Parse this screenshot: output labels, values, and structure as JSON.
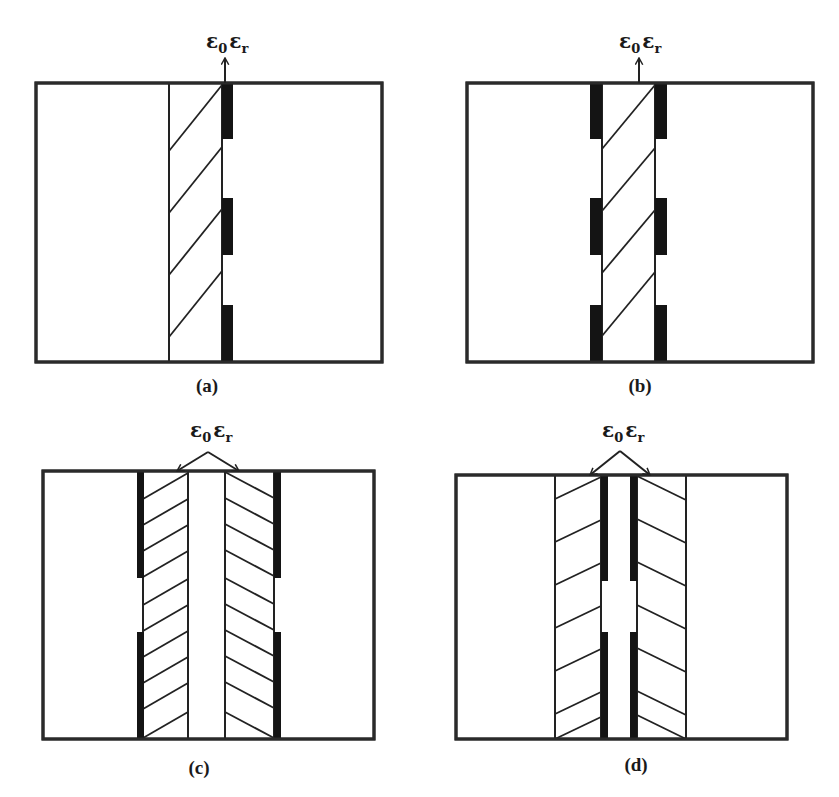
{
  "figure": {
    "colors": {
      "line": "#222222",
      "electrode": "#141414",
      "background": "#ffffff"
    },
    "permittivity_label": {
      "main": "ε",
      "sub0": "0",
      "mid": "ε",
      "subr": "r"
    },
    "panels": [
      {
        "id": "a",
        "label": "(a)",
        "frame": {
          "x": 36,
          "y": 83,
          "w": 346,
          "h": 279
        },
        "bounds": [
          169,
          222
        ],
        "electrodes": [
          {
            "x": 222,
            "y": 83,
            "w": 11,
            "h": 56
          },
          {
            "x": 222,
            "y": 198,
            "w": 11,
            "h": 57
          },
          {
            "x": 222,
            "y": 305,
            "w": 11,
            "h": 57
          }
        ],
        "hatches": [
          [
            169,
            151,
            222,
            85
          ],
          [
            169,
            213,
            222,
            147
          ],
          [
            169,
            275,
            222,
            209
          ],
          [
            169,
            337,
            222,
            271
          ]
        ],
        "label_pos": {
          "x": 207,
          "y": 392
        },
        "eps_pos": {
          "x": 206,
          "y": 48
        },
        "arrows": [
          {
            "from": [
              225,
              83
            ],
            "to": [
              225,
              58
            ]
          }
        ]
      },
      {
        "id": "b",
        "label": "(b)",
        "frame": {
          "x": 467,
          "y": 83,
          "w": 346,
          "h": 279
        },
        "bounds": [
          602,
          655
        ],
        "electrodes": [
          {
            "x": 590,
            "y": 83,
            "w": 12,
            "h": 56
          },
          {
            "x": 655,
            "y": 83,
            "w": 12,
            "h": 56
          },
          {
            "x": 590,
            "y": 198,
            "w": 12,
            "h": 57
          },
          {
            "x": 655,
            "y": 198,
            "w": 12,
            "h": 57
          },
          {
            "x": 590,
            "y": 305,
            "w": 12,
            "h": 57
          },
          {
            "x": 655,
            "y": 305,
            "w": 12,
            "h": 57
          }
        ],
        "hatches": [
          [
            602,
            149,
            655,
            85
          ],
          [
            602,
            211,
            655,
            148
          ],
          [
            602,
            273,
            655,
            210
          ],
          [
            602,
            336,
            655,
            272
          ]
        ],
        "label_pos": {
          "x": 640,
          "y": 392
        },
        "eps_pos": {
          "x": 619,
          "y": 48
        },
        "arrows": [
          {
            "from": [
              639,
              83
            ],
            "to": [
              639,
              58
            ]
          }
        ]
      },
      {
        "id": "c",
        "label": "(c)",
        "frame": {
          "x": 43,
          "y": 471,
          "w": 331,
          "h": 268
        },
        "bounds": [
          143,
          188,
          225,
          274
        ],
        "electrodes": [
          {
            "x": 137,
            "y": 471,
            "w": 7,
            "h": 107
          },
          {
            "x": 274,
            "y": 471,
            "w": 7,
            "h": 107
          },
          {
            "x": 137,
            "y": 632,
            "w": 7,
            "h": 107
          },
          {
            "x": 274,
            "y": 632,
            "w": 7,
            "h": 107
          }
        ],
        "hatches_left": {
          "x1": 143,
          "x2": 188,
          "dy": 26,
          "starts": [
            499,
            525,
            551,
            577,
            605,
            631,
            657,
            683,
            709,
            738
          ]
        },
        "hatches_right": {
          "x1": 225,
          "x2": 274,
          "dy": 26,
          "starts": [
            472,
            498,
            524,
            550,
            578,
            604,
            630,
            656,
            682,
            712
          ]
        },
        "label_pos": {
          "x": 199,
          "y": 774
        },
        "eps_pos": {
          "x": 190,
          "y": 437
        },
        "arrows": [
          {
            "from": [
              208,
              452
            ],
            "to": [
              177,
              471
            ]
          },
          {
            "from": [
              208,
              452
            ],
            "to": [
              239,
              471
            ]
          }
        ]
      },
      {
        "id": "d",
        "label": "(d)",
        "frame": {
          "x": 456,
          "y": 475,
          "w": 331,
          "h": 264
        },
        "bounds": [
          555,
          601,
          637,
          686
        ],
        "electrodes": [
          {
            "x": 601,
            "y": 475,
            "w": 7,
            "h": 106
          },
          {
            "x": 630,
            "y": 475,
            "w": 7,
            "h": 106
          },
          {
            "x": 601,
            "y": 632,
            "w": 7,
            "h": 107
          },
          {
            "x": 630,
            "y": 632,
            "w": 7,
            "h": 107
          }
        ],
        "hatches_left": {
          "x1": 555,
          "x2": 601,
          "dy": 22,
          "starts": [
            499,
            542,
            585,
            628,
            671,
            714,
            739
          ]
        },
        "hatches_right": {
          "x1": 637,
          "x2": 686,
          "dy": 24,
          "starts": [
            476,
            519,
            562,
            605,
            648,
            691,
            715
          ]
        },
        "label_pos": {
          "x": 636,
          "y": 771
        },
        "eps_pos": {
          "x": 602,
          "y": 437
        },
        "arrows": [
          {
            "from": [
              620,
              451
            ],
            "to": [
              590,
              475
            ]
          },
          {
            "from": [
              620,
              451
            ],
            "to": [
              650,
              475
            ]
          }
        ]
      }
    ]
  }
}
